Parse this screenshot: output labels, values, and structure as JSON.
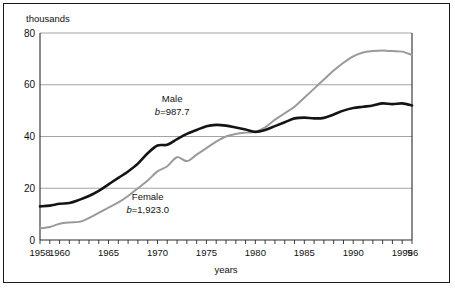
{
  "figure": {
    "background_color": "#ffffff",
    "border_color": "#1a1a1a"
  },
  "chart_data": {
    "type": "line",
    "title": "",
    "subtitle": "",
    "units_label": "thousands",
    "xlabel": "years",
    "ylabel": "",
    "xlim": [
      1958,
      1996
    ],
    "ylim": [
      0,
      80
    ],
    "grid": true,
    "gridlines_y": [
      0,
      20,
      40,
      60,
      80
    ],
    "legend_position": "inline-annotations",
    "y_ticks": [
      "0",
      "20",
      "40",
      "60",
      "80"
    ],
    "y_tick_values": [
      0,
      20,
      40,
      60,
      80
    ],
    "x_tick_labels": [
      "1958",
      "1960",
      "1965",
      "1970",
      "1975",
      "1980",
      "1985",
      "1990",
      "1995",
      "'96"
    ],
    "x_tick_label_values": [
      1958,
      1960,
      1965,
      1970,
      1975,
      1980,
      1985,
      1990,
      1995,
      1996
    ],
    "x_minor_ticks_every": 1,
    "x": [
      1958,
      1959,
      1960,
      1961,
      1962,
      1963,
      1964,
      1965,
      1966,
      1967,
      1968,
      1969,
      1970,
      1971,
      1972,
      1973,
      1974,
      1975,
      1976,
      1977,
      1978,
      1979,
      1980,
      1981,
      1982,
      1983,
      1984,
      1985,
      1986,
      1987,
      1988,
      1989,
      1990,
      1991,
      1992,
      1993,
      1994,
      1995,
      1996
    ],
    "series": [
      {
        "name": "Male",
        "color": "#141414",
        "annotation": "b=987.7",
        "annotation_b_symbol": "b",
        "annotation_b_value": "987.7",
        "values": [
          13.0,
          13.3,
          14.0,
          14.3,
          15.5,
          17.0,
          19.0,
          21.5,
          24.0,
          26.5,
          29.5,
          33.5,
          36.5,
          36.8,
          39.0,
          41.0,
          42.5,
          44.0,
          44.5,
          44.2,
          43.5,
          42.7,
          41.8,
          42.5,
          44.0,
          45.5,
          47.0,
          47.3,
          47.0,
          47.2,
          48.5,
          50.0,
          51.0,
          51.5,
          52.0,
          52.8,
          52.5,
          52.8,
          52.0
        ]
      },
      {
        "name": "Female",
        "color": "#9a9a9a",
        "annotation": "b=1,923.0",
        "annotation_b_symbol": "b",
        "annotation_b_value": "1,923.0",
        "values": [
          4.5,
          5.0,
          6.3,
          6.8,
          7.0,
          8.5,
          10.5,
          12.5,
          14.5,
          17.0,
          20.0,
          23.0,
          26.5,
          28.5,
          32.0,
          30.5,
          33.0,
          35.5,
          38.0,
          40.0,
          41.0,
          41.5,
          41.8,
          43.5,
          46.5,
          49.0,
          51.5,
          55.0,
          58.5,
          62.0,
          65.5,
          68.5,
          71.0,
          72.5,
          73.0,
          73.2,
          73.0,
          72.8,
          71.5
        ]
      }
    ],
    "annotations": [
      {
        "text": "Male",
        "x": 1971.5,
        "y": 53.5
      },
      {
        "text": "b=987.7",
        "x": 1971.5,
        "y": 48.5
      },
      {
        "text": "Female",
        "x": 1969.0,
        "y": 15.5
      },
      {
        "text": "b=1,923.0",
        "x": 1969.0,
        "y": 10.5
      }
    ]
  }
}
